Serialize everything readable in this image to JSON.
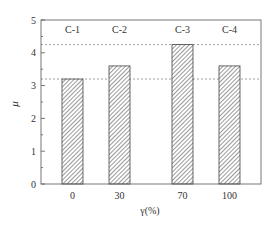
{
  "chart_data": {
    "type": "bar",
    "title": "",
    "xlabel": "γ(%)",
    "ylabel": "μ",
    "categories": [
      "0",
      "30",
      "70",
      "100"
    ],
    "bar_labels": [
      "C-1",
      "C-2",
      "C-3",
      "C-4"
    ],
    "values": [
      3.2,
      3.6,
      4.25,
      3.6
    ],
    "ylim": [
      0,
      5
    ],
    "yticks": [
      "0",
      "1",
      "2",
      "3",
      "4",
      "5"
    ],
    "reference_lines": [
      4.25,
      3.2
    ],
    "grid": false,
    "legend": null,
    "bar_fill": "diagonal hatch",
    "colors": {
      "axis": "#555555",
      "bar_edge": "#444444",
      "hatch": "#555555",
      "dashed": "#888888"
    }
  }
}
